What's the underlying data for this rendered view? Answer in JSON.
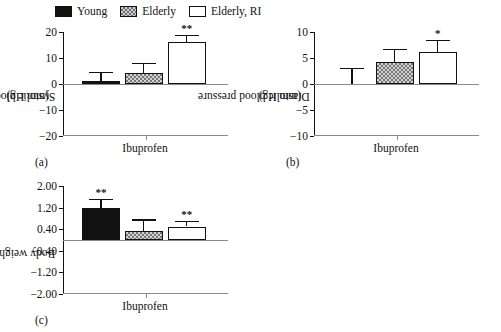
{
  "figure": {
    "legend": {
      "position": "top",
      "items": [
        {
          "label": "Young",
          "fill": "solid-black",
          "color": "#111111"
        },
        {
          "label": "Elderly",
          "fill": "hatched-gray",
          "color": "#777777"
        },
        {
          "label": "Elderly, RI",
          "fill": "white",
          "color": "#ffffff"
        }
      ]
    },
    "panels": [
      {
        "caption": "(a)"
      },
      {
        "caption": "(b)"
      },
      {
        "caption": "(c)"
      }
    ]
  },
  "chart_data": [
    {
      "type": "bar",
      "panel": "(a)",
      "title": "",
      "xlabel": "Ibuprofen",
      "ylabel": "Systolic blood pressure\n(mm Hg)",
      "ylabel_line1": "Systolic blood pressure",
      "ylabel_line2": "(mm Hg)",
      "categories": [
        "Ibuprofen"
      ],
      "ylim": [
        -20,
        20
      ],
      "yticks": [
        20,
        10,
        0,
        -10,
        -20
      ],
      "yticklabels": [
        "20",
        "10",
        "0",
        "−10",
        "−20"
      ],
      "grid": false,
      "series": [
        {
          "name": "Young",
          "values": [
            1.0
          ],
          "error": [
            3.5
          ],
          "annotation": ""
        },
        {
          "name": "Elderly",
          "values": [
            4.3
          ],
          "error": [
            3.9
          ],
          "annotation": ""
        },
        {
          "name": "Elderly, RI",
          "values": [
            16.0
          ],
          "error": [
            3.0
          ],
          "annotation": "**"
        }
      ]
    },
    {
      "type": "bar",
      "panel": "(b)",
      "title": "",
      "xlabel": "Ibuprofen",
      "ylabel": "Diastolic blood pressure\n(mm Hg)",
      "ylabel_line1": "Diastolic blood pressure",
      "ylabel_line2": "(mm Hg)",
      "categories": [
        "Ibuprofen"
      ],
      "ylim": [
        -10,
        10
      ],
      "yticks": [
        10,
        5,
        0,
        -5,
        -10
      ],
      "yticklabels": [
        "10",
        "5",
        "0",
        "−5",
        "−10"
      ],
      "grid": false,
      "series": [
        {
          "name": "Young",
          "values": [
            0.0
          ],
          "error": [
            3.1
          ],
          "annotation": ""
        },
        {
          "name": "Elderly",
          "values": [
            4.3
          ],
          "error": [
            2.4
          ],
          "annotation": ""
        },
        {
          "name": "Elderly, RI",
          "values": [
            6.1
          ],
          "error": [
            2.4
          ],
          "annotation": "*"
        }
      ]
    },
    {
      "type": "bar",
      "panel": "(c)",
      "title": "",
      "xlabel": "Ibuprofen",
      "ylabel": "Body weight (kg)",
      "ylabel_line1": "Body weight (kg)",
      "ylabel_line2": "",
      "categories": [
        "Ibuprofen"
      ],
      "ylim": [
        -2.0,
        2.0
      ],
      "yticks": [
        2.0,
        1.2,
        0.4,
        -0.4,
        -1.2,
        -2.0
      ],
      "yticklabels": [
        "2.00",
        "1.20",
        "0.40",
        "−0.40",
        "−1.20",
        "−2.00"
      ],
      "grid": false,
      "series": [
        {
          "name": "Young",
          "values": [
            1.2
          ],
          "error": [
            0.33
          ],
          "annotation": "**"
        },
        {
          "name": "Elderly",
          "values": [
            0.33
          ],
          "error": [
            0.43
          ],
          "annotation": ""
        },
        {
          "name": "Elderly, RI",
          "values": [
            0.5
          ],
          "error": [
            0.22
          ],
          "annotation": "**"
        }
      ]
    }
  ]
}
